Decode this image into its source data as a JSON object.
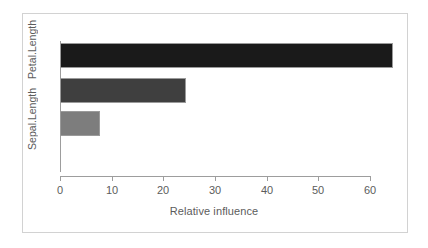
{
  "chart_data": {
    "type": "bar",
    "orientation": "horizontal",
    "title": "",
    "xlabel": "Relative influence",
    "ylabel": "",
    "categories": [
      "Sepal.Length",
      "Sepal.Width",
      "Petal.Length"
    ],
    "visible_category_labels": [
      "Petal.Length",
      "Sepal.Length"
    ],
    "values": [
      7.8,
      24.4,
      64.5
    ],
    "xlim": [
      0,
      62
    ],
    "xticks": [
      0,
      10,
      20,
      30,
      40,
      50,
      60
    ],
    "xticklabels": [
      "0",
      "10",
      "20",
      "30",
      "40",
      "50",
      "60"
    ],
    "grid": false,
    "legend": false,
    "bar_colors": [
      "#7d7d7d",
      "#3f3f3f",
      "#1a1a1a"
    ],
    "bar_border_color": "#9a9a9a",
    "axis_color": "#9d9d9d",
    "text_color": "#5c5c5c",
    "background": "#ffffff",
    "frame_color": "#d2d2d2",
    "bars": [
      {
        "label": "Petal.Length",
        "value": 64.5,
        "color": "#1a1a1a",
        "row": 0
      },
      {
        "label": "Sepal.Width",
        "value": 24.4,
        "color": "#3f3f3f",
        "row": 1
      },
      {
        "label": "Sepal.Length",
        "value": 7.8,
        "color": "#7d7d7d",
        "row": 2
      }
    ]
  },
  "axes": {
    "x_title": "Relative influence",
    "y_labels": [
      {
        "text": "Petal.Length",
        "top_px": 20
      },
      {
        "text": "Sepal.Length",
        "top_px": 88
      }
    ],
    "x_tick_labels": [
      "0",
      "10",
      "20",
      "30",
      "40",
      "50",
      "60"
    ]
  }
}
